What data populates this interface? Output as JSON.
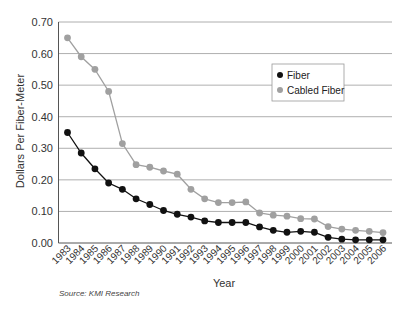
{
  "chart_data": {
    "type": "line",
    "title": "",
    "xlabel": "Year",
    "ylabel": "Dollars Per Fiber-Meter",
    "ylim": [
      0,
      0.7
    ],
    "yticks": [
      "0.00",
      "0.10",
      "0.20",
      "0.30",
      "0.40",
      "0.50",
      "0.60",
      "0.70"
    ],
    "grid": "horizontal",
    "legend_position": "upper right (inside plot)",
    "x": [
      "1983",
      "1984",
      "1985",
      "1986",
      "1987",
      "1988",
      "1989",
      "1990",
      "1991",
      "1992",
      "1993",
      "1994",
      "1995",
      "1996",
      "1997",
      "1998",
      "1999",
      "2000",
      "2001",
      "2002",
      "2003",
      "2004",
      "2005",
      "2006"
    ],
    "series": [
      {
        "name": "Fiber",
        "color": "#111111",
        "values": [
          0.35,
          0.285,
          0.235,
          0.19,
          0.17,
          0.14,
          0.122,
          0.103,
          0.091,
          0.082,
          0.07,
          0.065,
          0.065,
          0.065,
          0.051,
          0.04,
          0.034,
          0.037,
          0.034,
          0.018,
          0.012,
          0.01,
          0.01,
          0.01
        ]
      },
      {
        "name": "Cabled Fiber",
        "color": "#a0a0a0",
        "values": [
          0.65,
          0.59,
          0.55,
          0.48,
          0.315,
          0.248,
          0.24,
          0.228,
          0.218,
          0.17,
          0.14,
          0.128,
          0.128,
          0.13,
          0.095,
          0.088,
          0.085,
          0.077,
          0.076,
          0.052,
          0.044,
          0.04,
          0.037,
          0.033
        ]
      }
    ],
    "source": "Source: KMI Research"
  }
}
